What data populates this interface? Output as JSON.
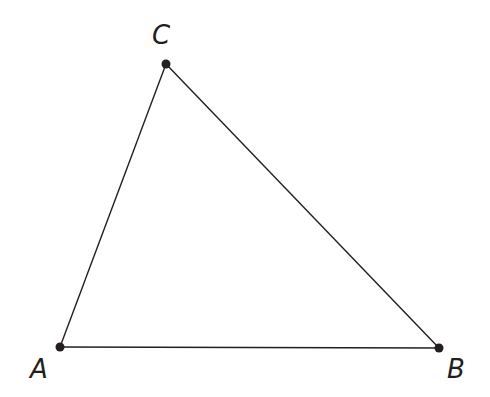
{
  "diagram": {
    "type": "triangle",
    "stroke_color": "#231f20",
    "point_color": "#231f20",
    "vertices": [
      {
        "id": "A",
        "label": "A",
        "x": 60,
        "y": 347,
        "label_x": 30,
        "label_y": 378
      },
      {
        "id": "B",
        "label": "B",
        "x": 439,
        "y": 348,
        "label_x": 447,
        "label_y": 378
      },
      {
        "id": "C",
        "label": "C",
        "x": 166,
        "y": 64,
        "label_x": 152,
        "label_y": 44
      }
    ],
    "edges": [
      {
        "from": "A",
        "to": "B"
      },
      {
        "from": "B",
        "to": "C"
      },
      {
        "from": "C",
        "to": "A"
      }
    ]
  }
}
